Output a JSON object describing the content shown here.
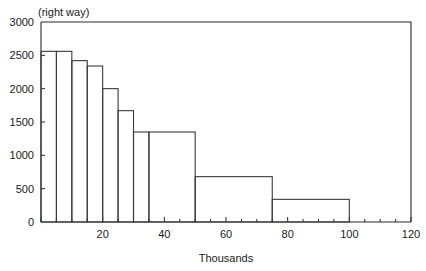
{
  "chart_data": {
    "type": "bar",
    "title": "",
    "annotation": "(right way)",
    "xlabel": "Thousands",
    "ylabel": "",
    "xlim": [
      0,
      120
    ],
    "ylim": [
      0,
      3000
    ],
    "grid": false,
    "legend": false,
    "histogram": true,
    "xticks": [
      0,
      20,
      40,
      60,
      80,
      100,
      120
    ],
    "xtick_labels": [
      "",
      "20",
      "40",
      "60",
      "80",
      "100",
      "120"
    ],
    "xminor_ticks": [
      5,
      10,
      15,
      25,
      30,
      35,
      45,
      50,
      55,
      65,
      70,
      75,
      85,
      90,
      95,
      105,
      110,
      115
    ],
    "yticks": [
      0,
      500,
      1000,
      1500,
      2000,
      2500,
      3000
    ],
    "ytick_labels": [
      "0",
      "500",
      "1000",
      "1500",
      "2000",
      "2500",
      "3000"
    ],
    "bins": [
      {
        "x0": 0,
        "x1": 5,
        "value": 2560
      },
      {
        "x0": 5,
        "x1": 10,
        "value": 2560
      },
      {
        "x0": 10,
        "x1": 15,
        "value": 2420
      },
      {
        "x0": 15,
        "x1": 20,
        "value": 2340
      },
      {
        "x0": 20,
        "x1": 25,
        "value": 2000
      },
      {
        "x0": 25,
        "x1": 30,
        "value": 1670
      },
      {
        "x0": 30,
        "x1": 35,
        "value": 1350
      },
      {
        "x0": 35,
        "x1": 50,
        "value": 1350
      },
      {
        "x0": 50,
        "x1": 75,
        "value": 680
      },
      {
        "x0": 75,
        "x1": 100,
        "value": 340
      }
    ],
    "categories": [
      "0-5",
      "5-10",
      "10-15",
      "15-20",
      "20-25",
      "25-30",
      "30-35",
      "35-50",
      "50-75",
      "75-100"
    ],
    "values": [
      2560,
      2560,
      2420,
      2340,
      2000,
      1670,
      1350,
      1350,
      680,
      340
    ],
    "colors": {
      "axis": "#2b2b2b",
      "bar_stroke": "#3a3a3a",
      "bar_fill": "#ffffff",
      "background": "#ffffff",
      "text": "#1a1a1a"
    }
  }
}
